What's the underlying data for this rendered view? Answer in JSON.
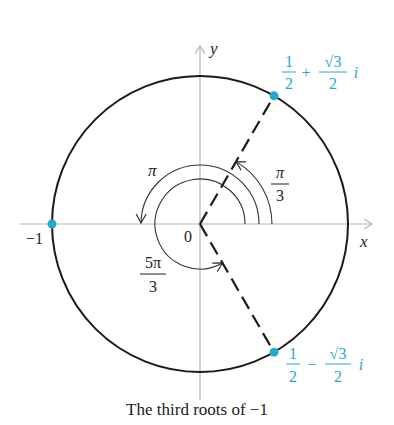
{
  "figure": {
    "caption": "The third roots of −1",
    "axes": {
      "x_label": "x",
      "y_label": "y",
      "origin_label": "0",
      "neg_one_label": "−1"
    },
    "angles": [
      {
        "name": "pi-over-3",
        "numerator": "π",
        "denominator": "3",
        "value_deg": 60
      },
      {
        "name": "pi",
        "label": "π",
        "value_deg": 180
      },
      {
        "name": "five-pi-over-3",
        "numerator": "5π",
        "denominator": "3",
        "value_deg": 300
      }
    ],
    "roots": [
      {
        "name": "root-upper",
        "re_num": "1",
        "re_den": "2",
        "sign": "+",
        "im_num": "√3",
        "im_den": "2",
        "unit": "i",
        "angle_deg": 60
      },
      {
        "name": "root-left",
        "value": "−1",
        "angle_deg": 180
      },
      {
        "name": "root-lower",
        "re_num": "1",
        "re_den": "2",
        "sign": "−",
        "im_num": "√3",
        "im_den": "2",
        "unit": "i",
        "angle_deg": 300
      }
    ],
    "colors": {
      "root": "#2aa8c8",
      "circle": "#1a1a1a",
      "axis": "#b5b5b5",
      "text": "#222222"
    }
  }
}
